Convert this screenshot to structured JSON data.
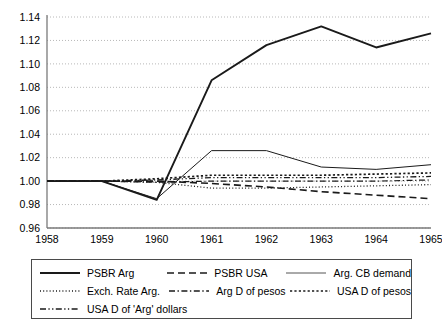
{
  "chart_data": {
    "type": "line",
    "title": "",
    "xlabel": "",
    "ylabel": "",
    "x": [
      1958,
      1959,
      1960,
      1961,
      1962,
      1963,
      1964,
      1965
    ],
    "categories": [
      "1958",
      "1959",
      "1960",
      "1961",
      "1962",
      "1963",
      "1964",
      "1965"
    ],
    "ylim": [
      0.96,
      1.14
    ],
    "yticks": [
      0.96,
      0.98,
      1.0,
      1.02,
      1.04,
      1.06,
      1.08,
      1.1,
      1.12,
      1.14
    ],
    "ytick_labels": [
      "0.96",
      "0.98",
      "1.00",
      "1.02",
      "1.04",
      "1.06",
      "1.08",
      "1.10",
      "1.12",
      "1.14"
    ],
    "grid": true,
    "grid_axis": "y",
    "legend_position": "bottom",
    "series": [
      {
        "name": "PSBR Arg",
        "style": "solid",
        "width": 1.9,
        "color": "#1a1a1a",
        "values": [
          1.0,
          1.0,
          0.984,
          1.086,
          1.116,
          1.132,
          1.114,
          1.126
        ]
      },
      {
        "name": "PSBR USA",
        "style": "dashed",
        "width": 1.6,
        "color": "#1a1a1a",
        "values": [
          1.0,
          1.0,
          1.0,
          0.998,
          0.995,
          0.991,
          0.988,
          0.985
        ]
      },
      {
        "name": "Arg. CB demand",
        "style": "solid",
        "width": 1.0,
        "color": "#555555",
        "values": [
          1.0,
          1.0,
          0.985,
          1.026,
          1.026,
          1.012,
          1.01,
          1.014
        ]
      },
      {
        "name": "Exch. Rate Arg.",
        "style": "dotted-fine",
        "width": 1.3,
        "color": "#1a1a1a",
        "values": [
          1.0,
          1.0,
          0.999,
          0.994,
          0.994,
          0.995,
          0.996,
          0.997
        ]
      },
      {
        "name": "Arg D of pesos",
        "style": "dashdot",
        "width": 1.2,
        "color": "#1a1a1a",
        "values": [
          1.0,
          1.0,
          0.999,
          1.0,
          1.0,
          1.0,
          1.0,
          1.001
        ]
      },
      {
        "name": "USA D of pesos",
        "style": "dotted-bold",
        "width": 1.7,
        "color": "#1a1a1a",
        "values": [
          1.0,
          1.0,
          1.002,
          1.005,
          1.005,
          1.005,
          1.006,
          1.007
        ]
      },
      {
        "name": "USA D of 'Arg' dollars",
        "style": "dashdotdot",
        "width": 1.3,
        "color": "#1a1a1a",
        "values": [
          1.0,
          1.0,
          1.001,
          1.003,
          1.003,
          1.003,
          1.003,
          1.004
        ]
      }
    ]
  },
  "legend": {
    "rows": [
      [
        {
          "label": "PSBR Arg",
          "style": "solid"
        },
        {
          "label": "PSBR USA",
          "style": "dashed"
        },
        {
          "label": "Arg. CB demand",
          "style": "solid-thin"
        }
      ],
      [
        {
          "label": "Exch. Rate Arg.",
          "style": "dotted-fine"
        },
        {
          "label": "Arg D of pesos",
          "style": "dashdot"
        },
        {
          "label": "USA D of pesos",
          "style": "dotted-bold"
        }
      ],
      [
        {
          "label": "USA D of 'Arg' dollars",
          "style": "dashdotdot"
        }
      ]
    ]
  }
}
